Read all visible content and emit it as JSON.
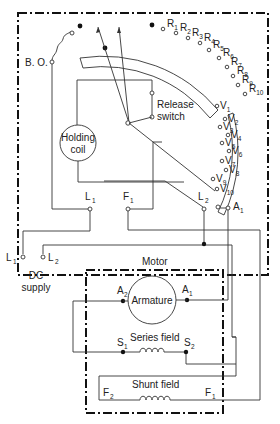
{
  "diagram": {
    "type": "four-point DC motor starter circuit",
    "starter": {
      "bo_label": "B. O.",
      "holding_coil": [
        "Holding",
        "coil"
      ],
      "release_switch": [
        "Release",
        "switch"
      ],
      "resistor_taps": [
        "R1",
        "R2",
        "R3",
        "R4",
        "R5",
        "R6",
        "R7",
        "R8",
        "R9",
        "R10"
      ],
      "voltage_taps": [
        "V1",
        "V2",
        "V3",
        "V4",
        "V5",
        "V6",
        "V7",
        "V8",
        "V9",
        "V10"
      ],
      "terminals": {
        "l1": "L",
        "f1": "F",
        "l2": "L",
        "a1": "A"
      }
    },
    "supply": {
      "l1": "L",
      "l2": "L",
      "label": [
        "DC",
        "supply"
      ]
    },
    "motor": {
      "title": "Motor",
      "armature": "Armature",
      "a1": "A",
      "a2": "A",
      "series_field": "Series field",
      "s1": "S",
      "s2": "S",
      "shunt_field": "Shunt field",
      "f1": "F",
      "f2": "F"
    },
    "subscripts": {
      "one": "1",
      "two": "2"
    }
  }
}
